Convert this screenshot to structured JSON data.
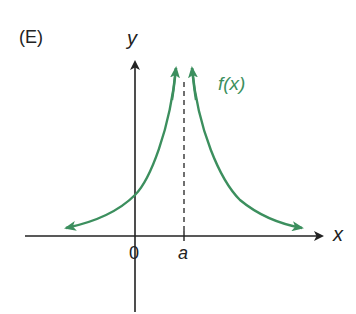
{
  "figure": {
    "panel_label": "(E)",
    "y_axis_label": "y",
    "x_axis_label": "x",
    "origin_label": "0",
    "asymptote_label": "a",
    "function_label": "f(x)"
  },
  "colors": {
    "axis": "#222222",
    "curve": "#3c8f5e",
    "asymptote": "#333333"
  }
}
